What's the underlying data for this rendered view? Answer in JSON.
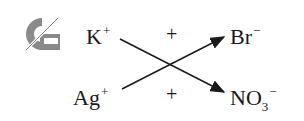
{
  "diagram": {
    "type": "double-displacement-reaction",
    "icon": "precipitate-logo-icon",
    "reactants": [
      {
        "symbol": "K",
        "charge": "+"
      },
      {
        "symbol": "Ag",
        "charge": "+"
      }
    ],
    "partners": [
      {
        "symbol": "Br",
        "charge": "−"
      },
      {
        "symbol": "NO",
        "subscript": "3",
        "charge": "−"
      }
    ],
    "operators": [
      "+",
      "+"
    ],
    "arrows": [
      {
        "from": "K+",
        "to": "NO3−"
      },
      {
        "from": "Ag+",
        "to": "Br−"
      }
    ],
    "colors": {
      "text": "#1a1a1a",
      "icon": "#8a8a8a"
    }
  }
}
